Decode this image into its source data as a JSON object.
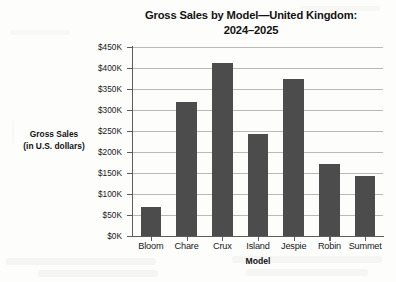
{
  "chart_data": {
    "type": "bar",
    "title": "Gross Sales by Model—United Kingdom: 2024–2025",
    "title_lines": [
      "Gross Sales by Model—United Kingdom:",
      "2024–2025"
    ],
    "xlabel": "Model",
    "ylabel": "Gross Sales (in U.S. dollars)",
    "ylabel_lines": [
      "Gross Sales",
      "(in U.S. dollars)"
    ],
    "categories": [
      "Bloom",
      "Chare",
      "Crux",
      "Island",
      "Jespie",
      "Robin",
      "Summet"
    ],
    "values": [
      70000,
      318000,
      412000,
      244000,
      374000,
      172000,
      143000
    ],
    "value_labels": [
      "$70K",
      "$318K",
      "$412K",
      "$244K",
      "$374K",
      "$172K",
      "$143K"
    ],
    "ylim": [
      0,
      450000
    ],
    "ytick_values": [
      0,
      50000,
      100000,
      150000,
      200000,
      250000,
      300000,
      350000,
      400000,
      450000
    ],
    "ytick_labels": [
      "$0K",
      "$50K",
      "$100K",
      "$150K",
      "$200K",
      "$250K",
      "$300K",
      "$350K",
      "$400K",
      "$450K"
    ],
    "grid": true,
    "grid_axis": "y",
    "legend": false,
    "bar_color": "#4c4c4c",
    "grid_color": "#b9b9b9",
    "axis_color": "#5c5c5c",
    "background_color": "#fdfdfc"
  }
}
